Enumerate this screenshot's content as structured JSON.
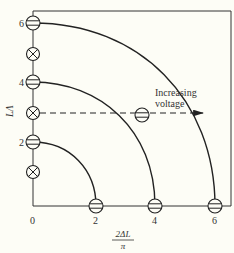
{
  "figure": {
    "background": "#fdfdf6",
    "line_color": "#222222",
    "annotation": {
      "line1": "Increasing",
      "line2": "voltage"
    },
    "x_axis": {
      "label_numerator": "2ΔL",
      "label_denominator": "π",
      "ticks": [
        "0",
        "2",
        "4",
        "6"
      ]
    },
    "y_axis": {
      "label": "LΛ",
      "ticks": [
        "2",
        "4",
        "6"
      ]
    },
    "symbols": {
      "bright_mode": "minus-circle (⊖) — lobe/mode maximum",
      "null_mode": "cross-circle (⊗)"
    },
    "arcs": [
      {
        "radius_label": "2"
      },
      {
        "radius_label": "4"
      },
      {
        "radius_label": "6"
      }
    ]
  }
}
